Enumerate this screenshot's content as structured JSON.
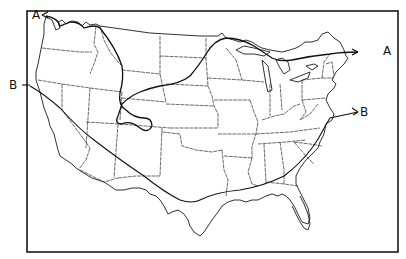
{
  "figure": {
    "type": "line map",
    "region": "Contiguous United States",
    "frame_color": "#1a1a1a",
    "background": "#ffffff"
  },
  "lines": [
    {
      "id": "A",
      "label": "A",
      "start_label_position": "upper-left (northwest, Washington coast)",
      "end_label_position": "right (Maine coast)",
      "path_description": "Runs from the Pacific Northwest east along the Canadian border, loops south through Montana/Wyoming into Colorado, then arcs northeast through the Dakotas and Minnesota over the Great Lakes to New England"
    },
    {
      "id": "B",
      "label": "B",
      "start_label_position": "left (northern California coast)",
      "end_label_position": "right (Delmarva / Virginia coast)",
      "path_description": "Runs from the northern California coast southeast across Nevada/Arizona, along southern New Mexico and Texas to the Gulf Coast, then northeast across Georgia and the Carolinas to the mid-Atlantic"
    }
  ],
  "labels": {
    "a_start": "A",
    "a_end": "A",
    "b_start": "B",
    "b_end": "B"
  }
}
